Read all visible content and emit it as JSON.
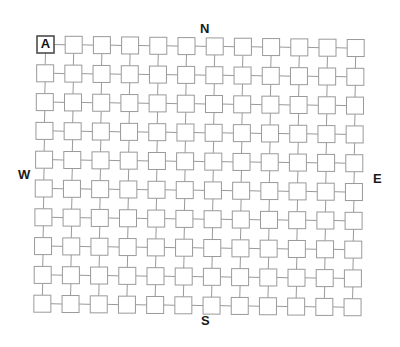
{
  "diagram": {
    "kind": "grid-of-connected-squares",
    "title": "",
    "columns": 12,
    "rows": 10,
    "cell_size": 17,
    "cell_pitch_x": 28.2,
    "cell_pitch_y": 28.8,
    "origin_x": 37,
    "origin_y": 36,
    "skew_x_per_row": -0.35,
    "skew_y_per_col": 0.32,
    "background_color": "#ffffff",
    "cell_fill_color": "#ffffff",
    "cell_stroke_color": "#9a9a9a",
    "cell_stroke_width": 1,
    "connector_color": "#9a9a9a",
    "connector_width": 1,
    "start_cell": {
      "label": "A",
      "row": 0,
      "column": 0,
      "stroke_color": "#4d4d4d",
      "stroke_width": 1.6,
      "text_color": "#111111"
    }
  },
  "compass": {
    "north": "N",
    "south": "S",
    "west": "W",
    "east": "E",
    "text_color": "#1a1a1a"
  }
}
